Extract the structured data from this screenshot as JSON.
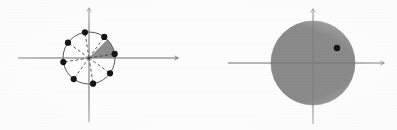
{
  "figure": {
    "background_color": "#fdfdfd",
    "width": 397,
    "height": 130,
    "caption": ""
  },
  "style": {
    "axis_color": "#6e6e6e",
    "axis_width": 1.0,
    "circle_stroke": "#5a5a5a",
    "circle_stroke_width": 1.0,
    "dashed_line_color": "#3c3c3c",
    "dashed_pattern": "3 2.4",
    "dot_color": "#151515",
    "sector_fill": "#8d8d8d",
    "disk_fill": "#8a8a8a",
    "disk_stroke": "#7a7a7a"
  },
  "chart_data": {
    "type": "scatter",
    "panels": [
      {
        "name": "left-panel",
        "label": "discrete-sampled-circle",
        "xlabel": "",
        "ylabel": "",
        "grid": false,
        "legend": null,
        "axes": {
          "origin_px": [
            89,
            58
          ],
          "x_axis_px": [
            18,
            58,
            178,
            58
          ],
          "y_axis_px": [
            89,
            8,
            89,
            122
          ],
          "x_arrow": "right",
          "y_arrow": "up",
          "xlim": [
            -2.7,
            3.4
          ],
          "ylim": [
            -2.45,
            1.92
          ]
        },
        "circle": {
          "center": [
            0,
            0
          ],
          "radius": 1.0,
          "radius_px": 26,
          "filled": false
        },
        "sector": {
          "start_angle_deg": 0,
          "end_angle_deg": 45,
          "radius": 1.0,
          "fill": "#8d8d8d",
          "label": "shaded-sector"
        },
        "spokes": {
          "count": 8,
          "style": "dashed",
          "angles_deg": [
            9,
            54,
            99,
            144,
            189,
            234,
            279,
            324
          ]
        },
        "points": {
          "count": 8,
          "marker": "filled-circle",
          "marker_size_px": 3.1,
          "angles_deg": [
            9,
            54,
            99,
            144,
            189,
            234,
            279,
            324
          ],
          "x": [
            0.988,
            0.588,
            -0.156,
            -0.809,
            -0.988,
            -0.588,
            0.156,
            0.809
          ],
          "y": [
            0.156,
            0.809,
            0.988,
            0.588,
            -0.156,
            -0.809,
            -0.988,
            -0.588
          ]
        }
      },
      {
        "name": "right-panel",
        "label": "filled-disk",
        "xlabel": "",
        "ylabel": "",
        "grid": false,
        "legend": null,
        "axes": {
          "origin_px": [
            313,
            63
          ],
          "x_axis_px": [
            228,
            63,
            384,
            63
          ],
          "y_axis_px": [
            313,
            9,
            313,
            124
          ],
          "x_arrow": "right",
          "y_arrow": "up",
          "xlim": [
            -2.02,
            1.69
          ],
          "ylim": [
            -1.45,
            1.29
          ]
        },
        "circle": {
          "center": [
            0,
            0
          ],
          "radius": 1.0,
          "radius_px": 42,
          "filled": true,
          "fill": "#8a8a8a"
        },
        "points": {
          "count": 1,
          "marker": "filled-circle",
          "marker_size_px": 3.2,
          "angles_deg": [
            28
          ],
          "x": [
            0.571
          ],
          "y": [
            0.357
          ],
          "label": "single-sample-point"
        }
      }
    ]
  }
}
